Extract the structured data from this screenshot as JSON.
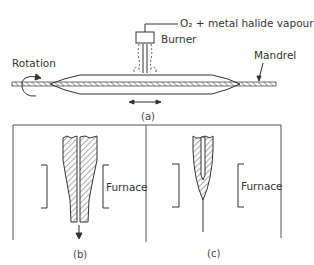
{
  "figure": {
    "part_a": {
      "caption": "(a)",
      "labels": {
        "gas_feed": "O₂ + metal halide vapours",
        "burner": "Burner",
        "mandrel": "Mandrel",
        "rotation": "Rotation"
      }
    },
    "part_b": {
      "caption": "(b)",
      "furnace_label": "Furnace"
    },
    "part_c": {
      "caption": "(c)",
      "furnace_label": "Furnace"
    },
    "colors": {
      "ink": "#333333",
      "background": "#ffffff"
    }
  }
}
